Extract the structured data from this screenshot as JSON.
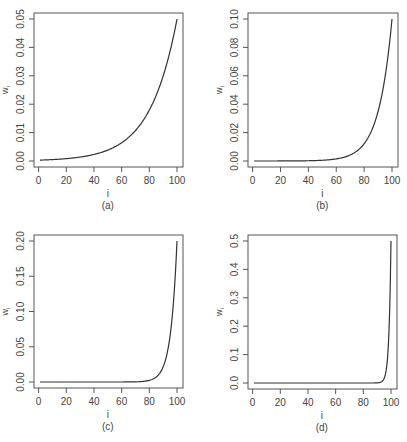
{
  "figure": {
    "panels": [
      "(a)",
      "(b)",
      "(c)",
      "(d)"
    ]
  },
  "chart_data": [
    {
      "type": "line",
      "panel_label": "(a)",
      "title": "",
      "xlabel": "i",
      "ylabel": "w_i",
      "xlim": [
        1,
        100
      ],
      "ylim": [
        0,
        0.05
      ],
      "x_ticks": [
        0,
        20,
        40,
        60,
        80,
        100
      ],
      "y_ticks": [
        0.0,
        0.01,
        0.02,
        0.03,
        0.04,
        0.05
      ],
      "y_tick_labels": [
        "0.00",
        "0.01",
        "0.02",
        "0.03",
        "0.04",
        "0.05"
      ],
      "grid": false,
      "series": [
        {
          "name": "w_i",
          "ratio": 0.95,
          "formula": "w_i = (1-q) q^(100-i)",
          "x": [
            1,
            20,
            40,
            60,
            70,
            80,
            90,
            95,
            100
          ],
          "y": [
            0.0003,
            0.0008,
            0.0023,
            0.0064,
            0.0107,
            0.0179,
            0.0299,
            0.0387,
            0.05
          ]
        }
      ]
    },
    {
      "type": "line",
      "panel_label": "(b)",
      "title": "",
      "xlabel": "i",
      "ylabel": "w_i",
      "xlim": [
        1,
        100
      ],
      "ylim": [
        0,
        0.1
      ],
      "x_ticks": [
        0,
        20,
        40,
        60,
        80,
        100
      ],
      "y_ticks": [
        0.0,
        0.02,
        0.04,
        0.06,
        0.08,
        0.1
      ],
      "y_tick_labels": [
        "0.00",
        "0.02",
        "0.04",
        "0.06",
        "0.08",
        "0.10"
      ],
      "grid": false,
      "series": [
        {
          "name": "w_i",
          "ratio": 0.9,
          "formula": "w_i = (1-q) q^(100-i)",
          "x": [
            1,
            40,
            60,
            70,
            80,
            90,
            95,
            100
          ],
          "y": [
            0.0,
            0.0002,
            0.0015,
            0.0042,
            0.0122,
            0.0349,
            0.059,
            0.1
          ]
        }
      ]
    },
    {
      "type": "line",
      "panel_label": "(c)",
      "title": "",
      "xlabel": "i",
      "ylabel": "w_i",
      "xlim": [
        1,
        100
      ],
      "ylim": [
        0,
        0.2
      ],
      "x_ticks": [
        0,
        20,
        40,
        60,
        80,
        100
      ],
      "y_ticks": [
        0.0,
        0.05,
        0.1,
        0.15,
        0.2
      ],
      "y_tick_labels": [
        "0.00",
        "0.05",
        "0.10",
        "0.15",
        "0.20"
      ],
      "grid": false,
      "series": [
        {
          "name": "w_i",
          "ratio": 0.8,
          "formula": "w_i = (1-q) q^(100-i)",
          "x": [
            1,
            60,
            80,
            85,
            90,
            95,
            100
          ],
          "y": [
            0.0,
            0.0,
            0.0023,
            0.007,
            0.0215,
            0.0655,
            0.2
          ]
        }
      ]
    },
    {
      "type": "line",
      "panel_label": "(d)",
      "title": "",
      "xlabel": "i",
      "ylabel": "w_i",
      "xlim": [
        1,
        100
      ],
      "ylim": [
        0,
        0.5
      ],
      "x_ticks": [
        0,
        20,
        40,
        60,
        80,
        100
      ],
      "y_ticks": [
        0.0,
        0.1,
        0.2,
        0.3,
        0.4,
        0.5
      ],
      "y_tick_labels": [
        "0.0",
        "0.1",
        "0.2",
        "0.3",
        "0.4",
        "0.5"
      ],
      "grid": false,
      "series": [
        {
          "name": "w_i",
          "ratio": 0.5,
          "formula": "w_i = (1-q) q^(100-i)",
          "x": [
            1,
            90,
            95,
            97,
            98,
            99,
            100
          ],
          "y": [
            0.0,
            0.0005,
            0.0156,
            0.0625,
            0.125,
            0.25,
            0.5
          ]
        }
      ]
    }
  ]
}
